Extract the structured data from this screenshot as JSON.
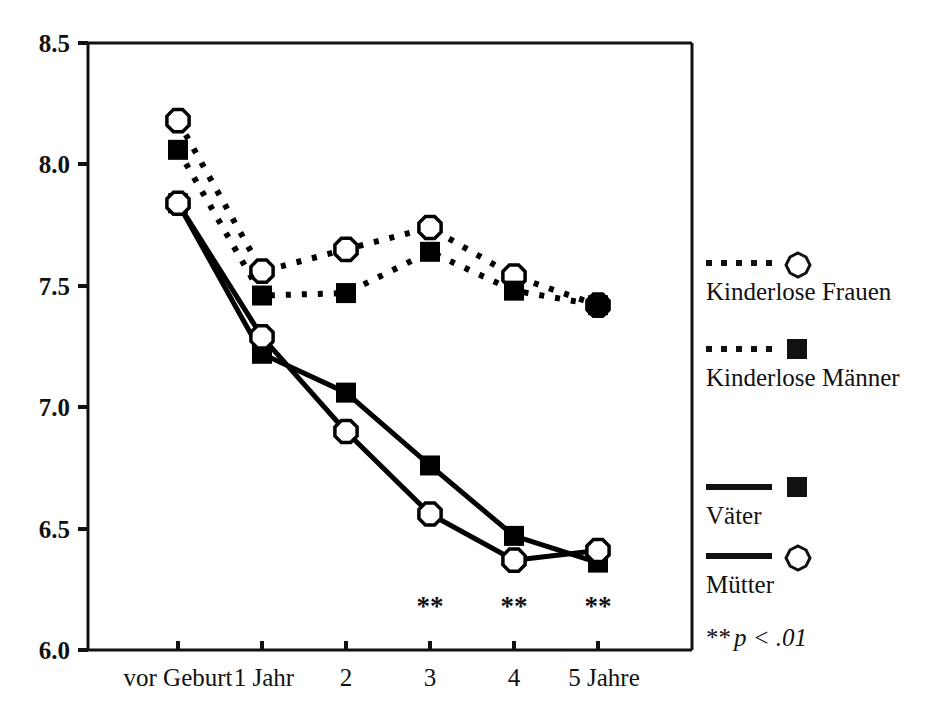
{
  "chart_data": {
    "type": "line",
    "title": "",
    "subtitle": "",
    "xlabel": "",
    "ylabel": "",
    "categories": [
      "vor Geburt",
      "1 Jahr",
      "2",
      "3",
      "4",
      "5 Jahre"
    ],
    "x_tick_labels": [
      "vor Geburt",
      "1 Jahr",
      "2",
      "3",
      "4",
      "5 Jahre"
    ],
    "y_tick_labels": [
      "6.0",
      "6.5",
      "7.0",
      "7.5",
      "8.0",
      "8.5"
    ],
    "y_ticks": [
      6.0,
      6.5,
      7.0,
      7.5,
      8.0,
      8.5
    ],
    "ylim": [
      6.0,
      8.5
    ],
    "grid": false,
    "legend_position": "right",
    "series": [
      {
        "name": "Kinderlose Frauen",
        "line_style": "dotted",
        "marker": "open-circle",
        "color": "#000000",
        "values": [
          8.18,
          7.56,
          7.65,
          7.74,
          7.54,
          7.42
        ]
      },
      {
        "name": "Kinderlose Männer",
        "line_style": "dotted",
        "marker": "filled-square",
        "color": "#000000",
        "values": [
          8.06,
          7.46,
          7.47,
          7.64,
          7.48,
          7.42
        ]
      },
      {
        "name": "Väter",
        "line_style": "solid",
        "marker": "filled-square",
        "color": "#000000",
        "values": [
          7.84,
          7.22,
          7.06,
          6.76,
          6.47,
          6.36
        ]
      },
      {
        "name": "Mütter",
        "line_style": "solid",
        "marker": "open-circle",
        "color": "#000000",
        "values": [
          7.84,
          7.29,
          6.9,
          6.56,
          6.37,
          6.41
        ]
      }
    ],
    "annotations": [
      {
        "text": "**",
        "category": "3"
      },
      {
        "text": "**",
        "category": "4"
      },
      {
        "text": "**",
        "category": "5 Jahre"
      }
    ],
    "footnote": {
      "stars": "**",
      "text": "p < .01"
    }
  },
  "legend": {
    "items": [
      {
        "label": "Kinderlose Frauen",
        "line_style": "dotted",
        "marker": "open-circle"
      },
      {
        "label": "Kinderlose Männer",
        "line_style": "dotted",
        "marker": "filled-square"
      },
      {
        "label": "Väter",
        "line_style": "solid",
        "marker": "filled-square"
      },
      {
        "label": "Mütter",
        "line_style": "solid",
        "marker": "open-circle"
      }
    ]
  },
  "axis": {
    "y_labels": [
      "8.5",
      "8.0",
      "7.5",
      "7.0",
      "6.5",
      "6.0"
    ],
    "x_labels": [
      "vor Geburt",
      "1 Jahr",
      "2",
      "3",
      "4",
      "5 Jahre"
    ]
  },
  "significance": {
    "marks": [
      "**",
      "**",
      "**"
    ]
  },
  "footnote": {
    "stars": "**",
    "text": "p < .01"
  }
}
